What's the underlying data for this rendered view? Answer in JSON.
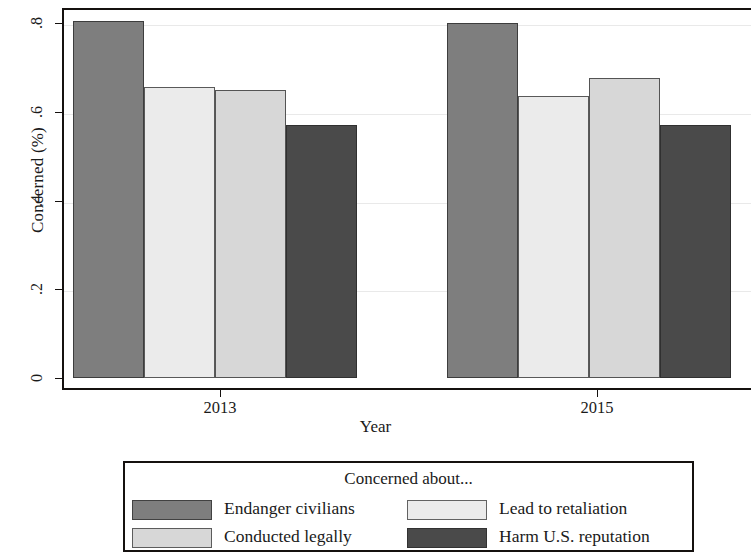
{
  "chart_data": {
    "type": "bar",
    "title": "",
    "xlabel": "Year",
    "ylabel": "Concerned (%)",
    "categories": [
      "2013",
      "2015"
    ],
    "ylim": [
      0,
      0.85
    ],
    "yticks": [
      "0",
      ".2",
      ".4",
      ".6",
      ".8"
    ],
    "ytick_values": [
      0,
      0.2,
      0.4,
      0.6,
      0.8
    ],
    "grid": true,
    "legend_position": "bottom",
    "legend_title": "Concerned about...",
    "series": [
      {
        "name": "Endanger civilians",
        "color": "#7e7e7e",
        "values": [
          0.805,
          0.8
        ]
      },
      {
        "name": "Conducted legally",
        "color": "#d7d7d7",
        "values": [
          0.65,
          0.675
        ]
      },
      {
        "name": "Lead to retaliation",
        "color": "#ebebeb",
        "values": [
          0.655,
          0.635
        ]
      },
      {
        "name": "Harm U.S. reputation",
        "color": "#4a4a4a",
        "values": [
          0.57,
          0.57
        ]
      }
    ],
    "series_draw_order": [
      "Endanger civilians",
      "Lead to retaliation",
      "Conducted legally",
      "Harm U.S. reputation"
    ]
  },
  "axes": {
    "y_title": "Concerned (%)",
    "x_title": "Year",
    "y_tick_labels": [
      "0",
      ".2",
      ".4",
      ".6",
      ".8"
    ],
    "x_tick_labels": [
      "2013",
      "2015"
    ]
  },
  "legend": {
    "title": "Concerned about...",
    "entries": [
      {
        "label": "Endanger civilians",
        "color": "#7e7e7e"
      },
      {
        "label": "Lead to retaliation",
        "color": "#ebebeb"
      },
      {
        "label": "Conducted legally",
        "color": "#d7d7d7"
      },
      {
        "label": "Harm U.S. reputation",
        "color": "#4a4a4a"
      }
    ]
  }
}
